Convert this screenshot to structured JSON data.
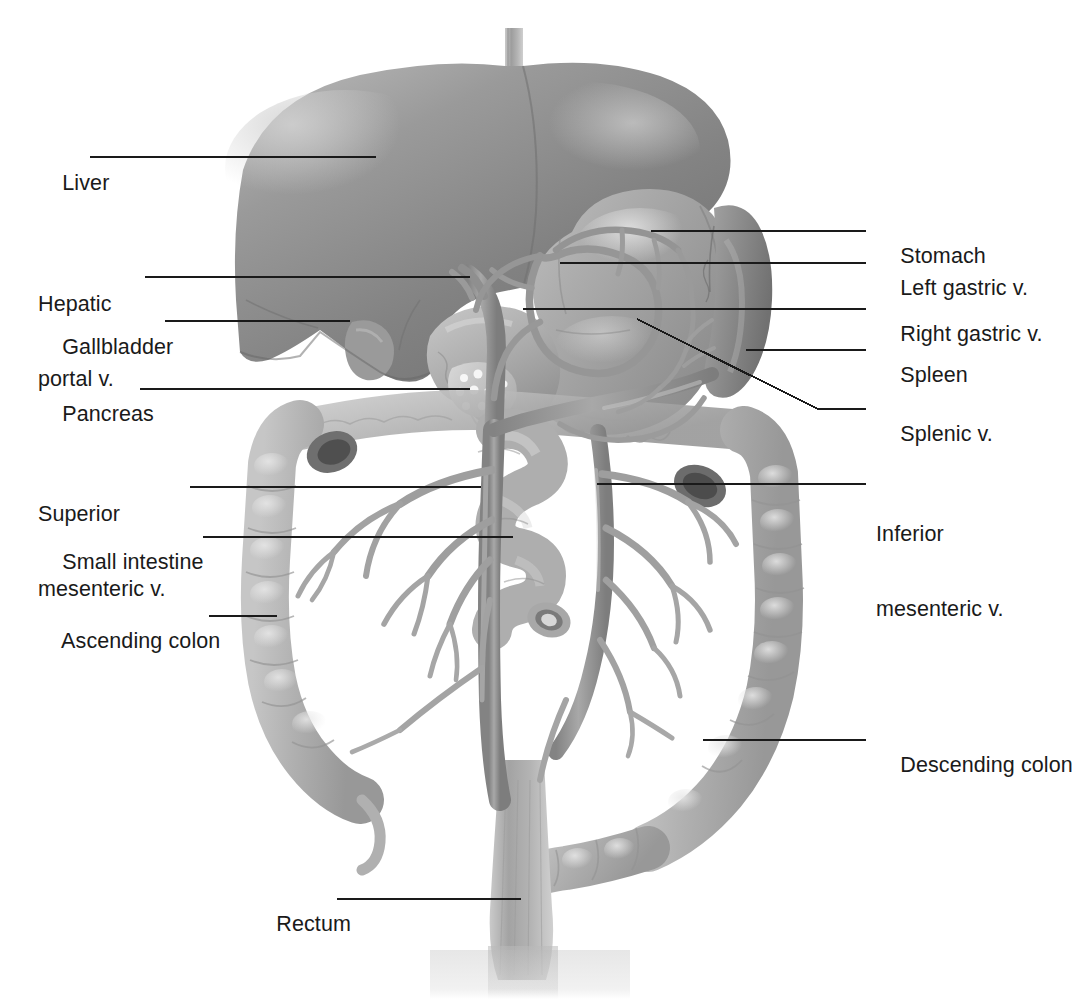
{
  "figure": {
    "background": "#ffffff",
    "width": 1067,
    "height": 999,
    "style": "grayscale medical illustration"
  },
  "palette": {
    "leader_line": "#1a1a1a",
    "label_text": "#1a1a1a",
    "liver_dark": "#7f7f7f",
    "liver_mid": "#8c8c8c",
    "liver_light": "#a5a5a5",
    "stomach": "#9c9c9c",
    "spleen": "#8f8f8f",
    "colon": "#b0b0b0",
    "small_intestine": "#a9a9a9",
    "vessel": "#949494",
    "pancreas": "#b6b6b6",
    "background": "#ffffff"
  },
  "labels_left": [
    {
      "id": "liver",
      "text": "Liver",
      "lines": [
        "Liver"
      ],
      "x": 38,
      "y": 146,
      "leader": {
        "x1": 90,
        "y1": 157,
        "x2": 376,
        "y2": 157
      }
    },
    {
      "id": "hepatic-portal-v",
      "text": "Hepatic portal v.",
      "lines": [
        "Hepatic",
        "portal v."
      ],
      "x": 38,
      "y": 242,
      "leader": {
        "x1": 145,
        "y1": 277,
        "x2": 470,
        "y2": 277
      }
    },
    {
      "id": "gallbladder",
      "text": "Gallbladder",
      "lines": [
        "Gallbladder"
      ],
      "x": 38,
      "y": 310,
      "leader": {
        "x1": 165,
        "y1": 321,
        "x2": 350,
        "y2": 321
      }
    },
    {
      "id": "pancreas",
      "text": "Pancreas",
      "lines": [
        "Pancreas"
      ],
      "x": 38,
      "y": 377,
      "leader": {
        "x1": 140,
        "y1": 389,
        "x2": 470,
        "y2": 389
      }
    },
    {
      "id": "superior-mesenteric-v",
      "text": "Superior mesenteric v.",
      "lines": [
        "Superior",
        "mesenteric v."
      ],
      "x": 38,
      "y": 452,
      "leader": {
        "x1": 190,
        "y1": 487,
        "x2": 481,
        "y2": 487
      }
    },
    {
      "id": "small-intestine",
      "text": "Small intestine",
      "lines": [
        "Small intestine"
      ],
      "x": 38,
      "y": 525,
      "leader": {
        "x1": 203,
        "y1": 537,
        "x2": 513,
        "y2": 537
      }
    },
    {
      "id": "ascending-colon",
      "text": "Ascending colon",
      "lines": [
        "Ascending colon"
      ],
      "x": 38,
      "y": 604,
      "leader": {
        "x1": 209,
        "y1": 616,
        "x2": 277,
        "y2": 616
      }
    },
    {
      "id": "rectum",
      "text": "Rectum",
      "lines": [
        "Rectum"
      ],
      "x": 252,
      "y": 887,
      "leader": {
        "x1": 337,
        "y1": 899,
        "x2": 521,
        "y2": 899
      }
    }
  ],
  "labels_right": [
    {
      "id": "stomach",
      "text": "Stomach",
      "lines": [
        "Stomach"
      ],
      "x": 876,
      "y": 219,
      "leader": {
        "x1": 651,
        "y1": 231,
        "x2": 866,
        "y2": 231
      }
    },
    {
      "id": "left-gastric-v",
      "text": "Left gastric v.",
      "lines": [
        "Left gastric v."
      ],
      "x": 876,
      "y": 251,
      "leader": {
        "x1": 560,
        "y1": 263,
        "x2": 866,
        "y2": 263
      }
    },
    {
      "id": "right-gastric-v",
      "text": "Right gastric v.",
      "lines": [
        "Right gastric v."
      ],
      "x": 876,
      "y": 297,
      "leader": {
        "x1": 523,
        "y1": 309,
        "x2": 866,
        "y2": 309
      }
    },
    {
      "id": "spleen",
      "text": "Spleen",
      "lines": [
        "Spleen"
      ],
      "x": 876,
      "y": 338,
      "leader": {
        "x1": 746,
        "y1": 350,
        "x2": 866,
        "y2": 350
      }
    },
    {
      "id": "splenic-v",
      "text": "Splenic v.",
      "lines": [
        "Splenic v."
      ],
      "x": 876,
      "y": 397,
      "leader_poly": "637,319 818,409 866,409"
    },
    {
      "id": "inferior-mesenteric-v",
      "text": "Inferior mesenteric v.",
      "lines": [
        "Inferior",
        "mesenteric v."
      ],
      "x": 876,
      "y": 472,
      "leader": {
        "x1": 597,
        "y1": 484,
        "x2": 866,
        "y2": 484
      }
    },
    {
      "id": "descending-colon",
      "text": "Descending colon",
      "lines": [
        "Descending colon"
      ],
      "x": 876,
      "y": 728,
      "leader": {
        "x1": 703,
        "y1": 740,
        "x2": 866,
        "y2": 740
      }
    }
  ],
  "structures": [
    {
      "id": "esophagus",
      "name": "Esophagus"
    },
    {
      "id": "liver",
      "name": "Liver"
    },
    {
      "id": "gallbladder",
      "name": "Gallbladder"
    },
    {
      "id": "stomach",
      "name": "Stomach"
    },
    {
      "id": "spleen",
      "name": "Spleen"
    },
    {
      "id": "pancreas",
      "name": "Pancreas"
    },
    {
      "id": "duodenum",
      "name": "Duodenum"
    },
    {
      "id": "small-intestine",
      "name": "Small intestine"
    },
    {
      "id": "ascending-colon",
      "name": "Ascending colon"
    },
    {
      "id": "transverse-colon",
      "name": "Transverse colon"
    },
    {
      "id": "descending-colon",
      "name": "Descending colon"
    },
    {
      "id": "sigmoid-colon",
      "name": "Sigmoid colon"
    },
    {
      "id": "rectum",
      "name": "Rectum"
    },
    {
      "id": "appendix",
      "name": "Appendix"
    },
    {
      "id": "hepatic-portal-v",
      "name": "Hepatic portal v."
    },
    {
      "id": "splenic-v",
      "name": "Splenic v."
    },
    {
      "id": "superior-mesenteric-v",
      "name": "Superior mesenteric v."
    },
    {
      "id": "inferior-mesenteric-v",
      "name": "Inferior mesenteric v."
    },
    {
      "id": "left-gastric-v",
      "name": "Left gastric v."
    },
    {
      "id": "right-gastric-v",
      "name": "Right gastric v."
    }
  ]
}
